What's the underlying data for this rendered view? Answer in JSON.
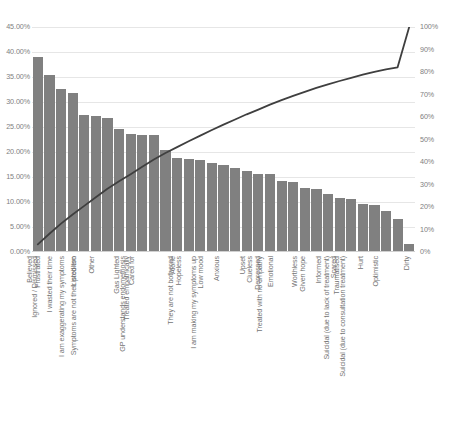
{
  "chart_data": {
    "type": "bar",
    "title": "",
    "subtitle": "",
    "xlabel": "",
    "ylabel": "",
    "y2label": "",
    "grid": true,
    "legend": "none",
    "ylim": [
      0,
      45
    ],
    "y2lim": [
      0,
      100
    ],
    "y_ticks": [
      "0.00%",
      "5.00%",
      "10.00%",
      "15.00%",
      "20.00%",
      "25.00%",
      "30.00%",
      "35.00%",
      "40.00%",
      "45.00%"
    ],
    "y2_ticks": [
      "0%",
      "10%",
      "20%",
      "30%",
      "40%",
      "50%",
      "60%",
      "70%",
      "80%",
      "90%",
      "100%"
    ],
    "bar_color": "#808080",
    "line_color": "#3f3f3f",
    "categories": [
      "Believed",
      "Frustrated",
      "Ignored / Dismissed",
      "I wasted their time",
      "Listed too",
      "Other",
      "I am exaggerating my symptoms",
      "Symptoms are not their problem",
      "Gas Lighted",
      "Cared for",
      "Treated empathically",
      "GP understands endometriosis",
      "Alone",
      "Hopeless",
      "They are not bothered",
      "Low mood",
      "Anxious",
      "I am making my symptoms up",
      "Upset",
      "Clueless",
      "Depressed",
      "Emotional",
      "Treated with no empathy",
      "Worthless",
      "Given hope",
      "Informed",
      "Scared",
      "Traumatised",
      "Hurt",
      "Suicidal (due to lack of treatment)",
      "Optimistic",
      "Suicidal (due to consultation treatment)",
      "Dirty"
    ],
    "values": [
      39.0,
      35.4,
      32.6,
      31.8,
      27.4,
      27.2,
      26.8,
      24.6,
      23.6,
      23.4,
      23.4,
      20.4,
      18.8,
      18.6,
      18.4,
      17.8,
      17.4,
      16.8,
      16.2,
      15.6,
      15.6,
      14.2,
      14.0,
      12.8,
      12.6,
      11.6,
      10.8,
      10.6,
      9.6,
      9.4,
      8.2,
      6.6,
      1.6
    ],
    "cumulative_percent": [
      3.4,
      8.1,
      12.6,
      16.7,
      20.5,
      24.3,
      28.1,
      31.4,
      34.6,
      37.9,
      41.1,
      44.0,
      46.6,
      49.2,
      51.7,
      54.2,
      56.6,
      58.9,
      61.2,
      63.3,
      65.5,
      67.5,
      69.4,
      71.2,
      72.9,
      74.5,
      76.0,
      77.4,
      78.8,
      80.1,
      81.2,
      82.1,
      100.0
    ]
  }
}
